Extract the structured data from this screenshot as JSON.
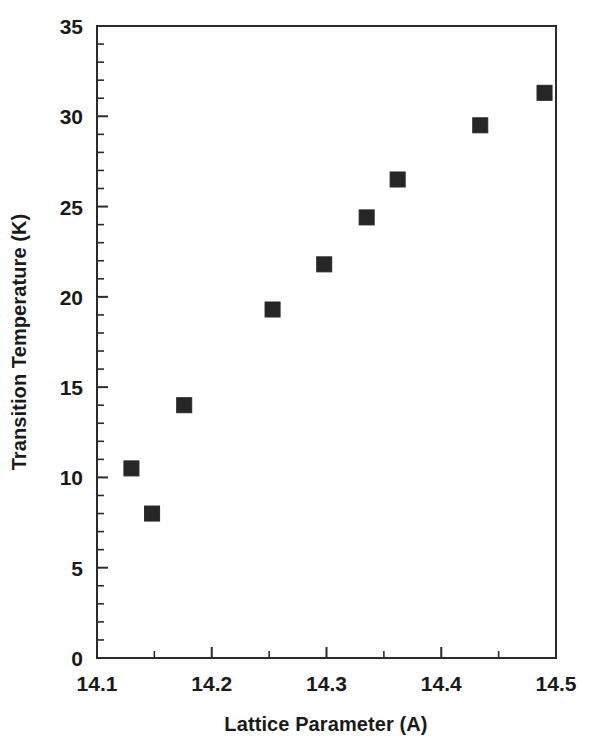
{
  "chart_data": {
    "type": "scatter",
    "title": "",
    "xlabel": "Lattice Parameter (A)",
    "ylabel": "Transition Temperature (K)",
    "xlim": [
      14.1,
      14.5
    ],
    "ylim": [
      0,
      35
    ],
    "grid": false,
    "legend": null,
    "x_major_ticks": [
      14.1,
      14.2,
      14.3,
      14.4,
      14.5
    ],
    "x_tick_labels": [
      "14.1",
      "14.2",
      "14.3",
      "14.4",
      "14.5"
    ],
    "x_minor_interval": 0.05,
    "y_major_ticks": [
      0,
      5,
      10,
      15,
      20,
      25,
      30,
      35
    ],
    "y_tick_labels": [
      "0",
      "5",
      "10",
      "15",
      "20",
      "25",
      "30",
      "35"
    ],
    "y_minor_interval": 1,
    "marker": "filled-square",
    "marker_color": "#262626",
    "series": [
      {
        "name": "Transition Temperature vs Lattice Parameter",
        "points": [
          {
            "x": 14.13,
            "y": 10.5
          },
          {
            "x": 14.148,
            "y": 8.0
          },
          {
            "x": 14.176,
            "y": 14.0
          },
          {
            "x": 14.253,
            "y": 19.3
          },
          {
            "x": 14.298,
            "y": 21.8
          },
          {
            "x": 14.335,
            "y": 24.4
          },
          {
            "x": 14.362,
            "y": 26.5
          },
          {
            "x": 14.434,
            "y": 29.5
          },
          {
            "x": 14.49,
            "y": 31.3
          }
        ]
      }
    ]
  },
  "labels": {
    "x_axis_title": "Lattice Parameter (A)",
    "y_axis_title": "Transition Temperature (K)"
  }
}
